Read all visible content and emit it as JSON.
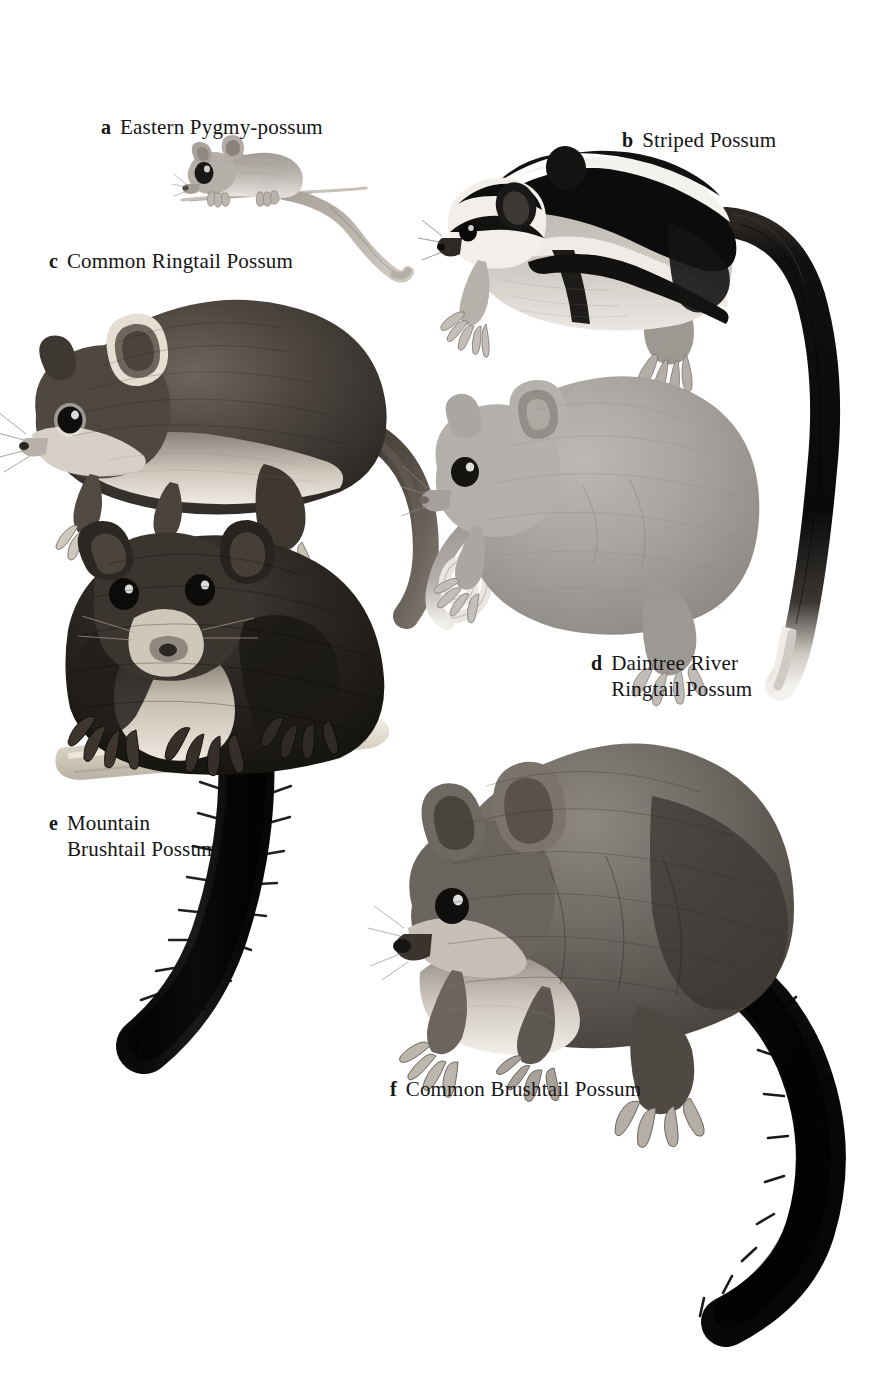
{
  "plate": {
    "background_color": "#ffffff",
    "text_color": "#151515",
    "figure_count": 6
  },
  "figures": [
    {
      "key": "a",
      "letter": "a",
      "name": "Eastern Pygmy-possum",
      "label_lines": [
        "Eastern Pygmy-possum"
      ],
      "label_position": "top-left",
      "description": "Small pale grey-brown possum clinging to a thin twig, facing left, with a long tapering naked tail curving down and to the right.",
      "fur_color": "#b9b3ad",
      "accent_color": "#6d6761",
      "size_class": "smallest"
    },
    {
      "key": "b",
      "letter": "b",
      "name": "Striped Possum",
      "label_lines": [
        "Striped Possum"
      ],
      "label_position": "top-right",
      "description": "Black and white longitudinally striped possum facing left, with a very long black bushy tail tipped white curving down the right side of the plate.",
      "fur_color": "#111111",
      "accent_color": "#f2f0ec",
      "size_class": "medium"
    },
    {
      "key": "c",
      "letter": "c",
      "name": "Common Ringtail Possum",
      "label_lines": [
        "Common Ringtail Possum"
      ],
      "label_position": "upper-left",
      "description": "Dark grey-brown ringtail possum facing left with pale cream cheeks and underside, white patch behind the ear, arched back, and a tapering tail with a white tip.",
      "fur_color": "#4a443f",
      "accent_color": "#ded8cf",
      "size_class": "medium"
    },
    {
      "key": "d",
      "letter": "d",
      "name": "Daintree River Ringtail Possum",
      "label_lines": [
        "Daintree River",
        "Ringtail Possum"
      ],
      "label_position": "middle-right",
      "description": "Pale silvery-grey ringtail possum facing left, with a long grey tail ending in a white tightly coiled tip.",
      "fur_color": "#a8a49f",
      "accent_color": "#ffffff",
      "size_class": "medium"
    },
    {
      "key": "e",
      "letter": "e",
      "name": "Mountain Brushtail Possum",
      "label_lines": [
        "Mountain",
        "Brushtail Possum"
      ],
      "label_position": "middle-left",
      "description": "Dark, almost black brushtail possum perched facing the viewer on a pale horizontal branch, with a thick bushy black tail hanging down and curving left.",
      "fur_color": "#2b2723",
      "accent_color": "#e8e3da",
      "size_class": "large"
    },
    {
      "key": "f",
      "letter": "f",
      "name": "Common Brushtail Possum",
      "label_lines": [
        "Common Brushtail Possum"
      ],
      "label_position": "bottom-centre",
      "description": "Large grey brushtail possum facing left with pale chest, large ears and pink nose, and a long bushy black tail sweeping down to the bottom right corner.",
      "fur_color": "#6f6a65",
      "accent_color": "#2a2724",
      "size_class": "largest"
    }
  ]
}
